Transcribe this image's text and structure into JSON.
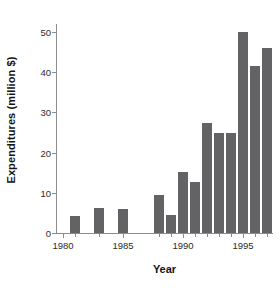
{
  "chart_data": {
    "type": "bar",
    "title": "",
    "subtitle": "",
    "xlabel": "Year",
    "ylabel": "Expenditures (million $)",
    "categories": [
      1981,
      1983,
      1985,
      1988,
      1989,
      1990,
      1991,
      1992,
      1993,
      1994,
      1995,
      1996,
      1997
    ],
    "values": [
      4.3,
      6.3,
      6.0,
      9.5,
      4.4,
      15.1,
      12.8,
      27.3,
      25.0,
      25.0,
      50.0,
      41.5,
      46.0
    ],
    "series": [
      {
        "name": "Expenditures",
        "values": [
          4.3,
          6.3,
          6.0,
          9.5,
          4.4,
          15.1,
          12.8,
          27.3,
          25.0,
          25.0,
          50.0,
          41.5,
          46.0
        ]
      }
    ],
    "missing_years": [
      1980,
      1982,
      1984,
      1986,
      1987
    ],
    "xlim": [
      1979.5,
      1997.5
    ],
    "ylim": [
      0,
      52
    ],
    "yticks": [
      0,
      10,
      20,
      30,
      40,
      50
    ],
    "ytick_labels": [
      "0",
      "10",
      "20",
      "30",
      "40",
      "50"
    ],
    "xticks": [
      1980,
      1985,
      1990,
      1995
    ],
    "xtick_labels": [
      "1980",
      "1985",
      "1990",
      "1995"
    ],
    "grid": false,
    "legend": null,
    "legend_position": "none",
    "bar_color": "#636366",
    "axis_color": "#8c8c8c",
    "background_color": "#ffffff",
    "annotations": []
  }
}
